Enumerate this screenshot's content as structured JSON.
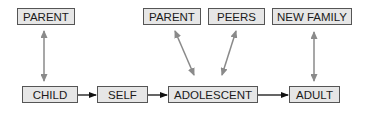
{
  "diagram": {
    "nodes": {
      "parent_left": "PARENT",
      "child": "CHILD",
      "self": "SELF",
      "parent_mid": "PARENT",
      "peers": "PEERS",
      "new_family": "NEW FAMILY",
      "adolescent": "ADOLESCENT",
      "adult": "ADULT"
    },
    "edges": [
      {
        "from": "CHILD",
        "to": "SELF",
        "type": "directed"
      },
      {
        "from": "SELF",
        "to": "ADOLESCENT",
        "type": "directed"
      },
      {
        "from": "ADOLESCENT",
        "to": "ADULT",
        "type": "directed"
      },
      {
        "from": "PARENT",
        "to": "CHILD",
        "type": "bidirectional"
      },
      {
        "from": "PARENT",
        "to": "ADOLESCENT",
        "type": "bidirectional"
      },
      {
        "from": "PEERS",
        "to": "ADOLESCENT",
        "type": "bidirectional"
      },
      {
        "from": "NEW FAMILY",
        "to": "ADULT",
        "type": "bidirectional"
      }
    ],
    "colors": {
      "box_fill": "#e6e6e6",
      "box_border": "#555555",
      "flow_arrow": "#111111",
      "relation_arrow": "#8a8a8a"
    }
  }
}
